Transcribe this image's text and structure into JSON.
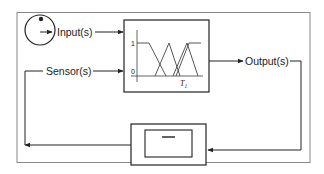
{
  "diagram": {
    "nodes": {
      "input": {
        "label": "Input(s)",
        "icon": "dial-knob-icon"
      },
      "sensor": {
        "label": "Sensor(s)"
      },
      "output": {
        "label": "Output(s)"
      },
      "controller": {
        "type": "fuzzy-membership-block",
        "y_ticks": [
          "1",
          "0"
        ],
        "x_label_main": "T",
        "x_label_sub": "1",
        "membership_functions": [
          "left-shoulder",
          "triangle",
          "triangle",
          "right-shoulder"
        ]
      },
      "plant": {
        "type": "process-block",
        "glyph": "—"
      }
    },
    "edges": [
      {
        "from": "input",
        "to": "controller"
      },
      {
        "from": "sensor",
        "to": "controller"
      },
      {
        "from": "controller",
        "to": "output"
      },
      {
        "from": "output",
        "to": "plant"
      },
      {
        "from": "plant",
        "to": "sensor"
      }
    ],
    "colors": {
      "line": "#333333",
      "frame": "#888888",
      "background": "#ffffff"
    }
  }
}
